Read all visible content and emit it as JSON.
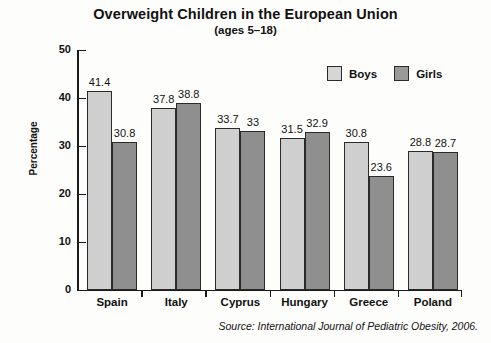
{
  "chart_data": {
    "type": "bar",
    "title": "Overweight Children in the European Union",
    "subtitle": "(ages 5–18)",
    "xlabel": "",
    "ylabel": "Percentage",
    "ylim": [
      0,
      50
    ],
    "yticks": [
      "0",
      "10",
      "20",
      "30",
      "40",
      "50"
    ],
    "grid": false,
    "legend_position": "top-right",
    "categories": [
      "Spain",
      "Italy",
      "Cyprus",
      "Hungary",
      "Greece",
      "Poland"
    ],
    "series": [
      {
        "name": "Boys",
        "color": "#cfcfcf",
        "values": [
          41.4,
          37.8,
          33.7,
          31.5,
          30.8,
          28.8
        ],
        "labels": [
          "41.4",
          "37.8",
          "33.7",
          "31.5",
          "30.8",
          "28.8"
        ]
      },
      {
        "name": "Girls",
        "color": "#8f8f8f",
        "values": [
          30.8,
          38.8,
          33,
          32.9,
          23.6,
          28.7
        ],
        "labels": [
          "30.8",
          "38.8",
          "33",
          "32.9",
          "23.6",
          "28.7"
        ]
      }
    ],
    "annotations": [
      "Source: International Journal of Pediatric Obesity, 2006."
    ]
  },
  "legend": {
    "items": [
      {
        "label": "Boys"
      },
      {
        "label": "Girls"
      }
    ]
  },
  "source": {
    "text": "Source: International Journal of Pediatric Obesity, 2006."
  }
}
